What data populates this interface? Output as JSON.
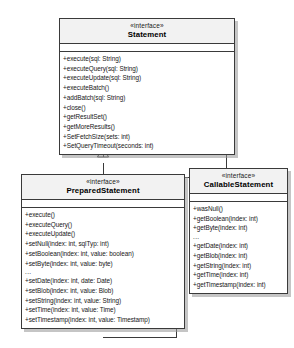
{
  "diagram": {
    "type": "uml-class-diagram",
    "stereotype_label": "«interface»",
    "ellipsis": "...",
    "colors": {
      "background": "#ffffff",
      "border": "#3a3a3a",
      "header_fill": "#f2f2f2",
      "shadow": "#969696",
      "text": "#161616"
    }
  },
  "classes": {
    "statement": {
      "stereotype": "«interface»",
      "name": "Statement",
      "operations": [
        "+execute(sql: String)",
        "+executeQuery(sql: String)",
        "+executeUpdate(sql: String)",
        "+executeBatch()",
        "+addBatch(sql: String)",
        "+close()",
        "+getResultSet()",
        "+getMoreResults()",
        "+SetFetchSize(sets: int)",
        "+SetQueryTimeout(seconds: int)"
      ]
    },
    "preparedstatement": {
      "stereotype": "«interface»",
      "name": "PreparedStatement",
      "operations_group1": [
        "+execute()",
        "+executeQuery()",
        "+executeUpdate()",
        "+setNull(index: int, sqlTyp: int)",
        "+setBoolean(index: int, value: boolean)",
        "+setByte(index: int, value: byte)"
      ],
      "operations_group2": [
        "+setDate(index: int, date: Date)",
        "+setBlob(index: int, value: Blob)",
        "+setString(index: int, value: String)",
        "+setTime(index: int, value: Time)",
        "+setTimestamp(index: int, value: Timestamp)"
      ]
    },
    "callablestatement": {
      "stereotype": "«interface»",
      "name": "CallableStatement",
      "operations_group1": [
        "+wasNull()",
        "+getBoolean(index: int)",
        "+getByte(index: int)"
      ],
      "operations_group2": [
        "+getDate(index: int)",
        "+getBlob(index: int)",
        "+getString(index: int)",
        "+getTime(index: int)",
        "+getTimestamp(index: int)"
      ]
    }
  },
  "relationships": [
    {
      "kind": "generalization",
      "from": "PreparedStatement",
      "to": "Statement"
    },
    {
      "kind": "generalization",
      "from": "CallableStatement",
      "to": "Statement"
    }
  ]
}
